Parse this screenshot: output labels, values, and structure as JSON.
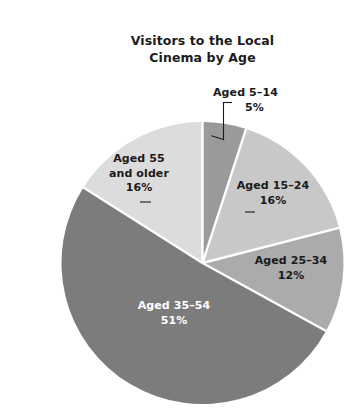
{
  "chart_data": {
    "type": "pie",
    "title": "Visitors to the Local Cinema by Age",
    "title_lines": [
      "Visitors to the Local",
      "Cinema by Age"
    ],
    "categories": [
      "Aged 5–14",
      "Aged 15–24",
      "Aged 25–34",
      "Aged 35–54",
      "Aged 55 and older"
    ],
    "values": [
      5,
      16,
      12,
      51,
      16
    ],
    "value_labels": [
      "5%",
      "16%",
      "12%",
      "51%",
      "16%"
    ],
    "unit": "%",
    "start_angle_deg": 0,
    "direction": "clockwise",
    "legend": "none",
    "grid": false,
    "slice_colors": [
      "#9a9a9a",
      "#c8c8c8",
      "#ababab",
      "#7c7c7c",
      "#dcdcdc"
    ],
    "slice_label_colors": [
      "#1a1a1a",
      "#1a1a1a",
      "#1a1a1a",
      "#ffffff",
      "#1a1a1a"
    ],
    "slices": [
      {
        "name": "Aged 5–14",
        "value": 5,
        "value_label": "5%",
        "color": "#9a9a9a",
        "label_placement": "outside",
        "leader_line": true
      },
      {
        "name": "Aged 15–24",
        "value": 16,
        "value_label": "16%",
        "color": "#c8c8c8",
        "label_placement": "inside",
        "leader_line": false
      },
      {
        "name": "Aged 25–34",
        "value": 12,
        "value_label": "12%",
        "color": "#ababab",
        "label_placement": "inside",
        "leader_line": false
      },
      {
        "name": "Aged 35–54",
        "value": 51,
        "value_label": "51%",
        "color": "#7c7c7c",
        "label_placement": "inside",
        "leader_line": false
      },
      {
        "name": "Aged 55 and older",
        "value": 16,
        "value_label": "16%",
        "color": "#dcdcdc",
        "label_placement": "inside",
        "leader_line": false
      }
    ]
  },
  "labels": {
    "age_5_14": {
      "name_line1": "Aged 5–14",
      "value": "5%"
    },
    "age_15_24": {
      "name": "Aged 15–24",
      "value": "16%"
    },
    "age_25_34": {
      "name": "Aged 25–34",
      "value": "12%"
    },
    "age_35_54": {
      "name": "Aged 35–54",
      "value": "51%"
    },
    "age_55_older": {
      "name_line1": "Aged 55",
      "name_line2": "and older",
      "value": "16%"
    }
  },
  "style": {
    "background": "#ffffff",
    "separator_color": "#ffffff",
    "text_color": "#1a1a1a",
    "leader_line_color": "#1a1a1a"
  }
}
